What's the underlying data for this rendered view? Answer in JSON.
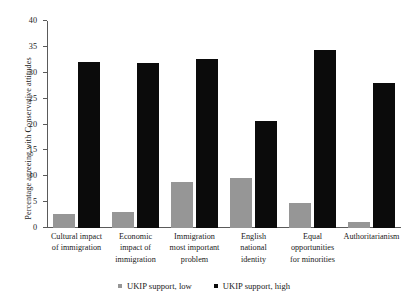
{
  "chart_data": {
    "type": "bar",
    "title": "",
    "xlabel": "",
    "ylabel": "Percentage agreeing with Conservative attitudes",
    "ylim": [
      0,
      40
    ],
    "yticks": [
      0,
      5,
      10,
      15,
      20,
      25,
      30,
      35,
      40
    ],
    "grid": false,
    "legend_position": "bottom",
    "categories": [
      "Cultural impact of immigration",
      "Economic impact of immigration",
      "Immigration most important problem",
      "English national identity",
      "Equal opportunities for minorities",
      "Authoritarianism"
    ],
    "category_lines": [
      [
        "Cultural impact",
        "of immigration"
      ],
      [
        "Economic",
        "impact of",
        "immigration"
      ],
      [
        "Immigration",
        "most important",
        "problem"
      ],
      [
        "English",
        "national",
        "identity"
      ],
      [
        "Equal",
        "opportunities",
        "for minorities"
      ],
      [
        "Authoritarianism"
      ]
    ],
    "series": [
      {
        "name": "UKIP support, low",
        "color": "#969696",
        "values": [
          2.8,
          3.1,
          8.8,
          9.6,
          4.8,
          1.1
        ]
      },
      {
        "name": "UKIP support, high",
        "color": "#0b0b0b",
        "values": [
          32.0,
          31.8,
          32.6,
          20.6,
          34.4,
          28.0
        ]
      }
    ]
  },
  "legend": {
    "items": [
      {
        "label": "UKIP support, low"
      },
      {
        "label": "UKIP support, high"
      }
    ]
  }
}
